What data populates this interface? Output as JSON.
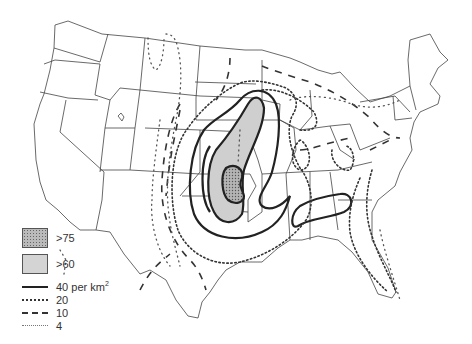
{
  "map": {
    "title": "",
    "region": "Contiguous United States",
    "unit": "per km²",
    "colors": {
      "shade_gt60": "#cfcfcf",
      "shade_gt75": "#a8a8a8",
      "lines": "#222222",
      "background": "#ffffff"
    }
  },
  "legend": {
    "fills": [
      {
        "label": ">75",
        "pattern": "stippled"
      },
      {
        "label": ">60",
        "pattern": "light-grey"
      }
    ],
    "lines": [
      {
        "label": "40 per km",
        "sup": "2",
        "style": "solid"
      },
      {
        "label": "20",
        "style": "dense-dotted"
      },
      {
        "label": "10",
        "style": "dashed"
      },
      {
        "label": "4",
        "style": "sparse-dotted"
      }
    ]
  }
}
